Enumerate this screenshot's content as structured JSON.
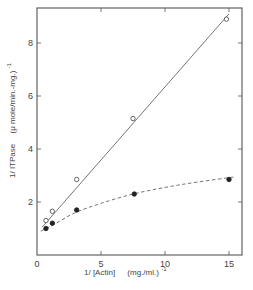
{
  "chart_data": {
    "type": "scatter",
    "title": "",
    "xlabel": "1/ [Actin]   (mg./ml.)⁻¹",
    "ylabel": "1/ ITPase   (μ mole/min.-mg.)⁻¹",
    "xlim": [
      0,
      16
    ],
    "ylim": [
      0,
      9.3
    ],
    "xticks": [
      0,
      5,
      10,
      15
    ],
    "yticks": [
      2,
      4,
      6,
      8
    ],
    "xtick_labels": [
      "0",
      "5",
      "10",
      "15"
    ],
    "ytick_labels": [
      "2",
      "4",
      "6",
      "8"
    ],
    "grid": false,
    "legend": null,
    "series": [
      {
        "name": "open circles",
        "marker": "open-circle",
        "line": "solid",
        "x": [
          0.7,
          1.2,
          3.1,
          7.5,
          14.8
        ],
        "y": [
          1.3,
          1.65,
          2.85,
          5.15,
          8.9
        ],
        "fit": {
          "type": "linear",
          "x": [
            0.4,
            15.0
          ],
          "y": [
            1.05,
            9.1
          ]
        }
      },
      {
        "name": "filled circles",
        "marker": "filled-circle",
        "line": "dashed",
        "x": [
          0.7,
          1.2,
          3.1,
          7.6,
          15.0
        ],
        "y": [
          1.0,
          1.2,
          1.7,
          2.3,
          2.85
        ],
        "fit": {
          "type": "curve",
          "x": [
            0.3,
            1.5,
            3,
            5,
            7.5,
            10,
            12.5,
            15.5
          ],
          "y": [
            0.9,
            1.2,
            1.6,
            1.95,
            2.3,
            2.55,
            2.75,
            2.95
          ]
        }
      }
    ]
  },
  "labels": {
    "x_axis_label_main": "1/ [Actin]",
    "x_axis_label_units": "(mg./ml.)",
    "x_axis_label_exp": "-1",
    "y_axis_label_main": "1/ ITPase",
    "y_axis_label_units": "(μ mole/min.-mg.)",
    "y_axis_label_exp": "-1"
  }
}
